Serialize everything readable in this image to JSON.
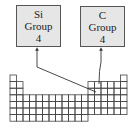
{
  "diagram": {
    "boxes": [
      {
        "symbol": "Si",
        "group_label": "Group",
        "group_number": "4"
      },
      {
        "symbol": "C",
        "group_label": "Group",
        "group_number": "4"
      }
    ],
    "colors": {
      "box_fill": "#e6e6e6",
      "box_border": "#555555",
      "grid_line": "#444444",
      "arrow": "#333333",
      "text": "#222222"
    },
    "periodic_table": {
      "columns": 18,
      "rows": 7,
      "description": "Outline of periodic table grid; arrows point from element boxes to carbon (period 2, group 14) and silicon (period 3, group 14)"
    }
  }
}
